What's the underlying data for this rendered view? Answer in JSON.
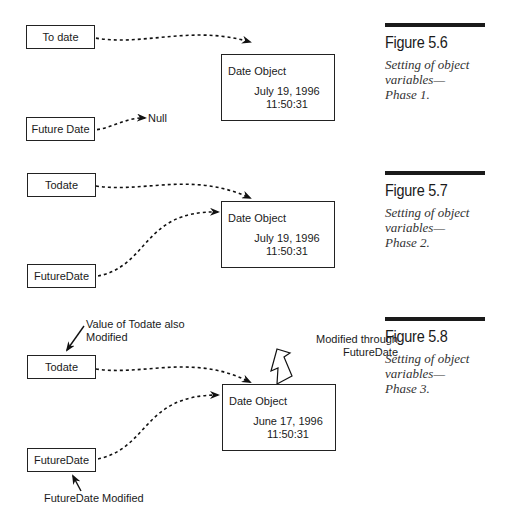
{
  "figures": [
    {
      "number": "Figure 5.6",
      "caption_lines": [
        "Setting of object",
        "variables—",
        "Phase 1."
      ],
      "variables": [
        {
          "label": "To date",
          "points_to": "Date Object"
        },
        {
          "label": "Future Date",
          "points_to": "Null"
        }
      ],
      "object": {
        "title": "Date  Object",
        "date": "July 19, 1996",
        "time": "11:50:31"
      },
      "null_label": "Null"
    },
    {
      "number": "Figure 5.7",
      "caption_lines": [
        "Setting of object",
        "variables—",
        "Phase 2."
      ],
      "variables": [
        {
          "label": "Todate",
          "points_to": "Date Object"
        },
        {
          "label": "FutureDate",
          "points_to": "Date Object"
        }
      ],
      "object": {
        "title": "Date  Object",
        "date": "July 19, 1996",
        "time": "11:50:31"
      }
    },
    {
      "number": "Figure 5.8",
      "caption_lines": [
        "Setting of object",
        "variables—",
        "Phase 3."
      ],
      "variables": [
        {
          "label": "Todate",
          "points_to": "Date Object"
        },
        {
          "label": "FutureDate",
          "points_to": "Date Object"
        }
      ],
      "object": {
        "title": "Date  Object",
        "date": "June 17, 1996",
        "time": "11:50:31"
      },
      "annotations": {
        "todate_note_line1": "Value of Todate also",
        "todate_note_line2": "Modified",
        "modified_through_line1": "Modified through",
        "modified_through_line2": "FutureDate",
        "futuredate_note": "FutureDate Modified"
      }
    }
  ],
  "icons": {
    "dashed_arrow": "dashed-curved-arrow",
    "hollow_arrow": "hollow-block-arrow",
    "solid_arrow": "solid-arrow"
  }
}
